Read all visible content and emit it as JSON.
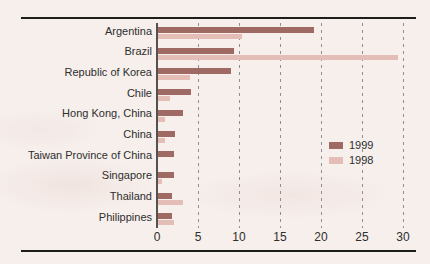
{
  "figure": {
    "background": "#f6efec",
    "plot_background": "#fdfcfa"
  },
  "colors": {
    "bar_1999": "#a06a64",
    "bar_1998": "#e3bdb6",
    "rule": "#1d1d1b",
    "axis": "#55514d",
    "gridline": "#8f8f8f",
    "text": "#2e2e2c"
  },
  "chart_data": {
    "type": "bar",
    "orientation": "horizontal",
    "title": "",
    "xlabel": "",
    "ylabel": "",
    "xlim": [
      0,
      30
    ],
    "xticks": [
      0,
      5,
      10,
      15,
      20,
      25,
      30
    ],
    "grid": "vertical-dashed",
    "legend_position": "center-right",
    "categories": [
      "Argentina",
      "Brazil",
      "Republic of Korea",
      "Chile",
      "Hong Kong, China",
      "China",
      "Taiwan Province of China",
      "Singapore",
      "Thailand",
      "Philippines"
    ],
    "series": [
      {
        "name": "1999",
        "color": "#a06a64",
        "values": [
          19.0,
          9.3,
          8.9,
          4.0,
          3.1,
          2.1,
          2.0,
          2.0,
          1.7,
          1.7
        ]
      },
      {
        "name": "1998",
        "color": "#e3bdb6",
        "values": [
          10.3,
          29.3,
          3.9,
          1.5,
          0.9,
          0.8,
          0.0,
          0.5,
          3.1,
          1.9
        ]
      }
    ]
  }
}
